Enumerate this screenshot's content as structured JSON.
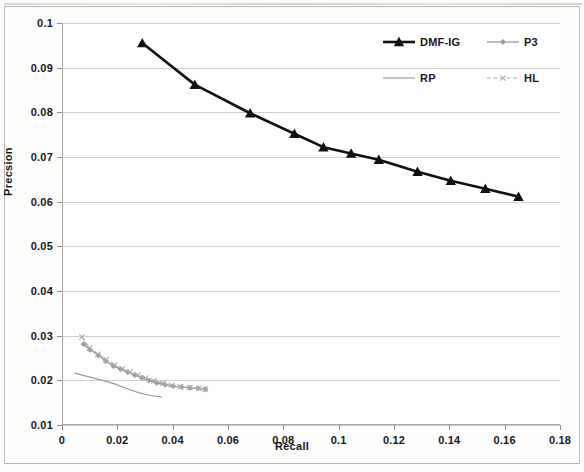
{
  "chart_data": {
    "type": "line",
    "title": "",
    "xlabel": "Recall",
    "ylabel": "Precsion",
    "xlim": [
      0,
      0.18
    ],
    "ylim": [
      0.01,
      0.1
    ],
    "xticks": [
      "0",
      "0.02",
      "0.04",
      "0.06",
      "0.08",
      "0.1",
      "0.12",
      "0.14",
      "0.16",
      "0.18"
    ],
    "xtick_values": [
      0,
      0.02,
      0.04,
      0.06,
      0.08,
      0.1,
      0.12,
      0.14,
      0.16,
      0.18
    ],
    "yticks": [
      "0.01",
      "0.02",
      "0.03",
      "0.04",
      "0.05",
      "0.06",
      "0.07",
      "0.08",
      "0.09",
      "0.1"
    ],
    "ytick_values": [
      0.01,
      0.02,
      0.03,
      0.04,
      0.05,
      0.06,
      0.07,
      0.08,
      0.09,
      0.1
    ],
    "grid": "horizontal",
    "legend_position": "top-right",
    "series": [
      {
        "name": "DMF-IG",
        "color": "#111111",
        "marker": "triangle",
        "line_style": "solid",
        "line_width": 2.6,
        "x": [
          0.029,
          0.048,
          0.068,
          0.084,
          0.0945,
          0.1045,
          0.1145,
          0.1285,
          0.1405,
          0.153,
          0.165
        ],
        "y": [
          0.0955,
          0.0862,
          0.0798,
          0.0752,
          0.0722,
          0.0708,
          0.0694,
          0.0667,
          0.0647,
          0.0629,
          0.0611
        ]
      },
      {
        "name": "P3",
        "color": "#9a9a9a",
        "marker": "diamond",
        "line_style": "solid",
        "line_width": 1.3,
        "x": [
          0.0078,
          0.0102,
          0.0132,
          0.0158,
          0.0186,
          0.0212,
          0.0238,
          0.0262,
          0.0288,
          0.0314,
          0.0342,
          0.0372,
          0.0402,
          0.0432,
          0.0462,
          0.0492,
          0.0518
        ],
        "y": [
          0.0281,
          0.0268,
          0.0256,
          0.0243,
          0.0232,
          0.0225,
          0.0218,
          0.0212,
          0.0206,
          0.02,
          0.0194,
          0.019,
          0.0187,
          0.0185,
          0.0183,
          0.0182,
          0.018
        ]
      },
      {
        "name": "RP",
        "color": "#9a9a9a",
        "marker": "none",
        "line_style": "solid",
        "line_width": 1.2,
        "x": [
          0.0046,
          0.009,
          0.014,
          0.019,
          0.024,
          0.028,
          0.032,
          0.0358
        ],
        "y": [
          0.0216,
          0.0209,
          0.0201,
          0.0192,
          0.018,
          0.0172,
          0.0166,
          0.0163
        ]
      },
      {
        "name": "HL",
        "color": "#ababab",
        "marker": "x",
        "line_style": "dashed",
        "line_width": 1.1,
        "x": [
          0.0072,
          0.01,
          0.013,
          0.016,
          0.019,
          0.0218,
          0.0246,
          0.0274,
          0.0302,
          0.0332,
          0.0364,
          0.0396,
          0.0428,
          0.0462,
          0.0494,
          0.0518
        ],
        "y": [
          0.0297,
          0.0272,
          0.0258,
          0.0246,
          0.0234,
          0.0226,
          0.0219,
          0.0212,
          0.0205,
          0.0199,
          0.0193,
          0.0189,
          0.0186,
          0.0184,
          0.0182,
          0.018
        ]
      }
    ]
  },
  "legend": {
    "entries": [
      {
        "label": "DMF-IG"
      },
      {
        "label": "P3"
      },
      {
        "label": "RP"
      },
      {
        "label": "HL"
      }
    ]
  }
}
